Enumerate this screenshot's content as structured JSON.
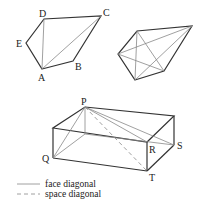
{
  "figure1": {
    "labels": {
      "A": "A",
      "B": "B",
      "C": "C",
      "D": "D",
      "E": "E"
    }
  },
  "figure3": {
    "labels": {
      "P": "P",
      "Q": "Q",
      "R": "R",
      "S": "S",
      "T": "T"
    }
  },
  "legend": {
    "face": "face diagonal",
    "space": "space diagonal"
  }
}
